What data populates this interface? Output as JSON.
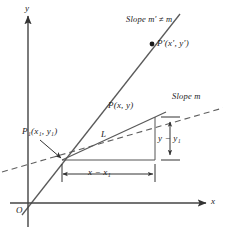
{
  "figure": {
    "axes": {
      "y_label": "y",
      "x_label": "x",
      "origin_label": "O"
    },
    "labels": {
      "slope_m_prime": "Slope m′ ≠ m",
      "slope_m": "Slope m",
      "point_p_prime": "P′(x′, y′)",
      "point_p": "P(x, y)",
      "point_p1": "P₁(x₁, y₁)",
      "segment_l": "L",
      "rise": "y − y₁",
      "run": "x − x₁"
    },
    "colors": {
      "ink": "#1a1a1a",
      "line": "#555555",
      "axis": "#444444",
      "background": "#ffffff"
    },
    "geometry": {
      "origin": [
        28,
        203
      ],
      "p1": [
        62,
        160
      ],
      "p": [
        155,
        117
      ],
      "corner": [
        155,
        160
      ],
      "p_prime": [
        152,
        44
      ]
    }
  }
}
